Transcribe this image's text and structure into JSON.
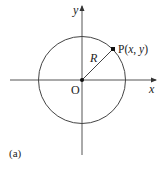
{
  "figure": {
    "panel_label": "(a)",
    "axes": {
      "x_label": "x",
      "y_label": "y",
      "origin_label": "O"
    },
    "circle": {
      "radius_label": "R"
    },
    "point": {
      "label_prefix": "P(",
      "label_x": "x",
      "label_sep": ", ",
      "label_y": "y",
      "label_suffix": ")"
    },
    "colors": {
      "stroke": "#333333",
      "background": "#ffffff"
    }
  }
}
